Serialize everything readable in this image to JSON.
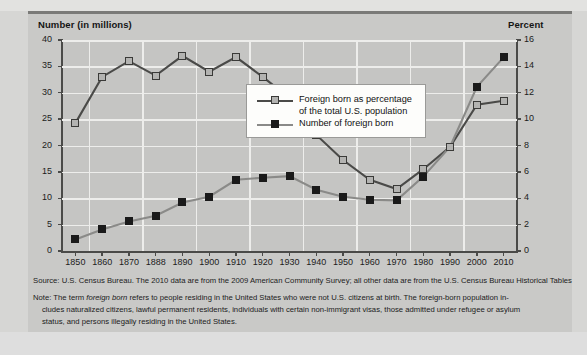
{
  "chart_data": {
    "type": "line",
    "title": "",
    "x": [
      "1850",
      "1860",
      "1870",
      "1888",
      "1890",
      "1900",
      "1910",
      "1920",
      "1930",
      "1940",
      "1950",
      "1960",
      "1970",
      "1980",
      "1990",
      "2000",
      "2010"
    ],
    "xlabel": "",
    "axes": {
      "left": {
        "label": "Number (in millions)",
        "ticks": [
          0,
          5,
          10,
          15,
          20,
          25,
          30,
          35,
          40
        ],
        "min": 0,
        "max": 40
      },
      "right": {
        "label": "Percent",
        "ticks": [
          0,
          2,
          4,
          6,
          8,
          10,
          12,
          14,
          16
        ],
        "min": 0,
        "max": 16
      }
    },
    "grid": true,
    "legend_position": "center",
    "series": [
      {
        "name": "Foreign born as percentage of the total U.S. population",
        "axis": "right",
        "marker": "square-light",
        "color": "#b3b3b1",
        "values": [
          9.7,
          13.2,
          14.4,
          13.3,
          14.8,
          13.6,
          14.7,
          13.2,
          11.6,
          8.8,
          6.9,
          5.4,
          4.7,
          6.2,
          7.9,
          11.1,
          11.4
        ]
      },
      {
        "name": "Number of foreign born",
        "axis": "left",
        "marker": "square-dark",
        "color": "#1a1a1a",
        "values": [
          2.2,
          4.1,
          5.6,
          6.7,
          9.2,
          10.3,
          13.5,
          13.9,
          14.2,
          11.6,
          10.3,
          9.7,
          9.6,
          14.1,
          19.8,
          31.1,
          36.7
        ]
      }
    ]
  },
  "axis_titles": {
    "left": "Number (in millions)",
    "right": "Percent"
  },
  "legend": {
    "items": [
      {
        "label_line1": "Foreign born as percentage",
        "label_line2": "of the total U.S. population",
        "swatch": "square-light"
      },
      {
        "label_line1": "Number of foreign born",
        "label_line2": "",
        "swatch": "square-dark"
      }
    ]
  },
  "footnotes": {
    "source": "Source: U.S. Census Bureau. The 2010 data are from the 2009 American Community Survey; all other data are from the U.S. Census Bureau Historical Tables",
    "note_line1_a": "Note: The term ",
    "note_line1_italic": "foreign born",
    "note_line1_b": " refers to people residing in the United States who were not U.S. citizens at birth. The foreign-born population in-",
    "note_line2": "cludes naturalized citizens, lawful permanent residents, individuals with certain non-immigrant visas, those admitted under refugee or asylum",
    "note_line3": "status, and persons illegally residing in the United States."
  },
  "colors": {
    "panel": "#c9c9c7",
    "plot": "#c5c5c3",
    "grid": "#ededeb",
    "axis": "#4a4a48",
    "series_percent": "#b3b3b1",
    "series_number": "#1a1a1a",
    "legend_bg": "#fdfdfb"
  }
}
